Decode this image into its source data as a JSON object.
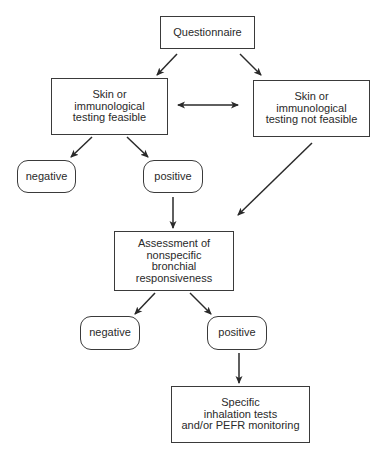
{
  "diagram": {
    "nodes": {
      "questionnaire": {
        "lines": [
          "Questionnaire"
        ]
      },
      "feasible": {
        "lines": [
          "Skin or",
          "immunological",
          "testing feasible"
        ]
      },
      "not_feasible": {
        "lines": [
          "Skin or",
          "immunological",
          "testing not feasible"
        ]
      },
      "negative_1": {
        "lines": [
          "negative"
        ]
      },
      "positive_1": {
        "lines": [
          "positive"
        ]
      },
      "assessment": {
        "lines": [
          "Assessment of",
          "nonspecific",
          "bronchial",
          "responsiveness"
        ]
      },
      "negative_2": {
        "lines": [
          "negative"
        ]
      },
      "positive_2": {
        "lines": [
          "positive"
        ]
      },
      "specific": {
        "lines": [
          "Specific",
          "inhalation tests",
          "and/or PEFR monitoring"
        ]
      }
    },
    "edges": [
      {
        "from": "questionnaire",
        "to": "feasible"
      },
      {
        "from": "questionnaire",
        "to": "not_feasible"
      },
      {
        "from": "feasible",
        "to": "not_feasible",
        "bidirectional": true
      },
      {
        "from": "feasible",
        "to": "negative_1"
      },
      {
        "from": "feasible",
        "to": "positive_1"
      },
      {
        "from": "positive_1",
        "to": "assessment"
      },
      {
        "from": "not_feasible",
        "to": "assessment"
      },
      {
        "from": "assessment",
        "to": "negative_2"
      },
      {
        "from": "assessment",
        "to": "positive_2"
      },
      {
        "from": "positive_2",
        "to": "specific"
      }
    ],
    "colors": {
      "line": "#2a2a2a",
      "border": "#3a3a3a",
      "background": "#ffffff"
    }
  }
}
